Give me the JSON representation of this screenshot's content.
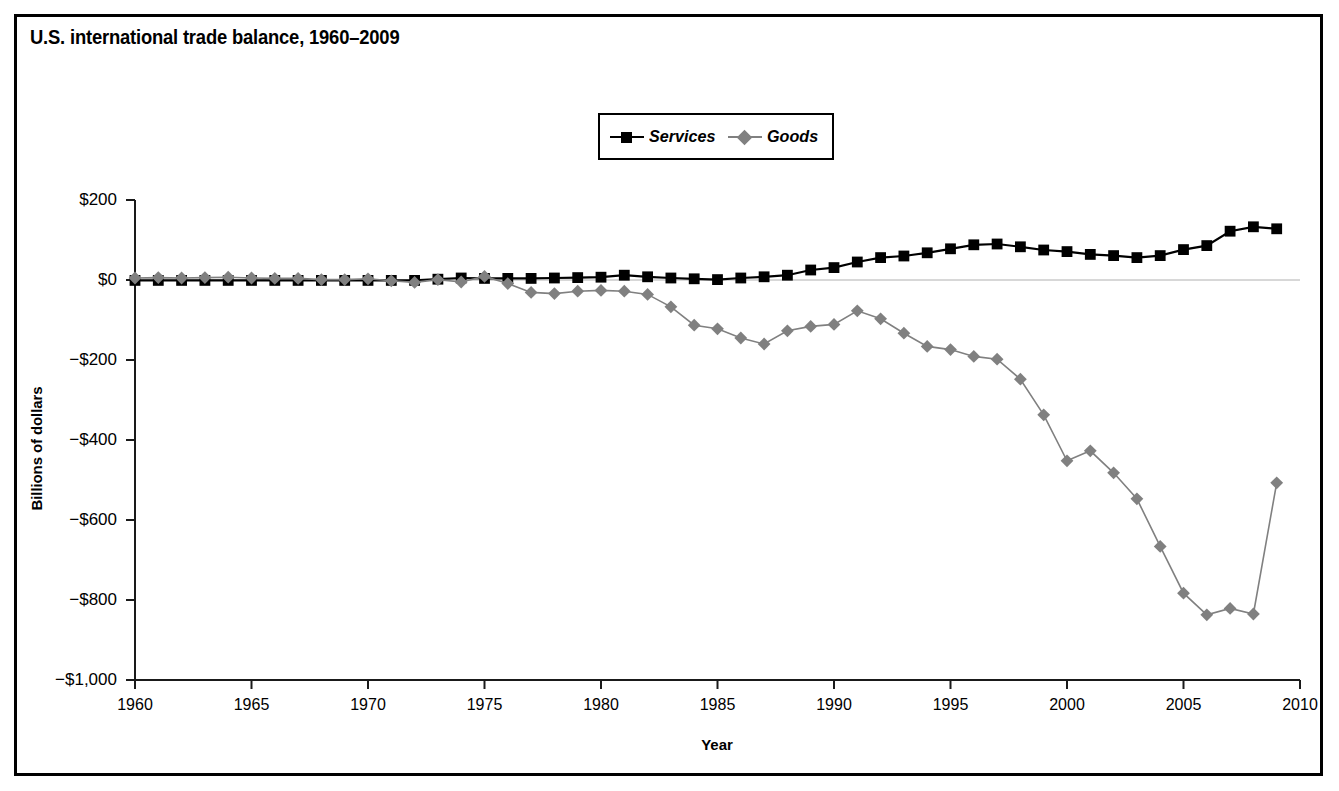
{
  "figure": {
    "title": "U.S. international trade balance, 1960–2009",
    "border_color": "#000000",
    "background": "#ffffff"
  },
  "legend": {
    "position": "top-center",
    "entries": [
      {
        "label": "Services",
        "color": "#000000",
        "marker": "square"
      },
      {
        "label": "Goods",
        "color": "#808080",
        "marker": "diamond"
      }
    ]
  },
  "axes": {
    "ylabel": "Billions of dollars",
    "xlabel": "Year",
    "ytick_labels": [
      "$200",
      "$0",
      "−$200",
      "−$400",
      "−$600",
      "−$800",
      "−$1,000"
    ],
    "xtick_labels": [
      "1960",
      "1965",
      "1970",
      "1975",
      "1980",
      "1985",
      "1990",
      "1995",
      "2000",
      "2005",
      "2010"
    ]
  },
  "chart_data": {
    "type": "line",
    "title": "U.S. international trade balance, 1960–2009",
    "xlabel": "Year",
    "ylabel": "Billions of dollars",
    "xlim": [
      1960,
      2010
    ],
    "ylim": [
      -1000,
      200
    ],
    "yticks": [
      200,
      0,
      -200,
      -400,
      -600,
      -800,
      -1000
    ],
    "xticks": [
      1960,
      1965,
      1970,
      1975,
      1980,
      1985,
      1990,
      1995,
      2000,
      2005,
      2010
    ],
    "grid": false,
    "legend_position": "top-center",
    "x": [
      1960,
      1961,
      1962,
      1963,
      1964,
      1965,
      1966,
      1967,
      1968,
      1969,
      1970,
      1971,
      1972,
      1973,
      1974,
      1975,
      1976,
      1977,
      1978,
      1979,
      1980,
      1981,
      1982,
      1983,
      1984,
      1985,
      1986,
      1987,
      1988,
      1989,
      1990,
      1991,
      1992,
      1993,
      1994,
      1995,
      1996,
      1997,
      1998,
      1999,
      2000,
      2001,
      2002,
      2003,
      2004,
      2005,
      2006,
      2007,
      2008,
      2009
    ],
    "series": [
      {
        "name": "Services",
        "color": "#000000",
        "marker": "square",
        "values": [
          -1,
          -1,
          -1,
          -1,
          -1,
          -1,
          -1,
          -1,
          -1,
          -1,
          -1,
          -1,
          -1,
          2,
          5,
          4,
          4,
          4,
          5,
          6,
          7,
          12,
          8,
          5,
          3,
          1,
          5,
          8,
          12,
          25,
          31,
          45,
          56,
          60,
          68,
          78,
          88,
          90,
          83,
          75,
          71,
          64,
          61,
          56,
          61,
          76,
          86,
          122,
          133,
          128
        ]
      },
      {
        "name": "Goods",
        "color": "#808080",
        "marker": "diamond",
        "values": [
          5,
          6,
          5,
          6,
          7,
          5,
          4,
          4,
          1,
          1,
          3,
          -2,
          -6,
          1,
          -5,
          9,
          -9,
          -31,
          -34,
          -28,
          -26,
          -28,
          -36,
          -67,
          -113,
          -122,
          -145,
          -160,
          -127,
          -116,
          -111,
          -77,
          -97,
          -133,
          -166,
          -174,
          -191,
          -198,
          -248,
          -337,
          -452,
          -427,
          -482,
          -547,
          -666,
          -783,
          -837,
          -821,
          -835,
          -507
        ]
      }
    ]
  }
}
